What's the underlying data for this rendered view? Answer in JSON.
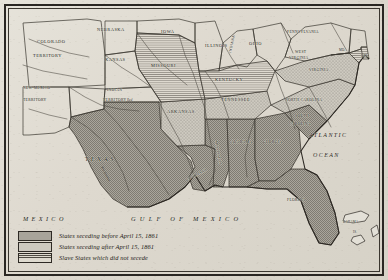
{
  "figure": {
    "name": "secession-map"
  },
  "legend": {
    "name": "map-legend",
    "entries": [
      {
        "swatch": "dense-stipple",
        "label": "States seceding before April 15, 1861"
      },
      {
        "swatch": "light-stipple",
        "label": "States seceding after April 15, 1861"
      },
      {
        "swatch": "horizontal-lines",
        "label": "Slave States which did not secede"
      }
    ]
  },
  "water_bodies": [
    {
      "name": "ATLANTIC",
      "line2": "OCEAN"
    },
    {
      "name": "GULF OF MEXICO"
    }
  ],
  "countries": [
    {
      "name": "MEXICO"
    }
  ],
  "rivers": [
    {
      "name": "Rio Grande"
    },
    {
      "name": "Red"
    }
  ],
  "islands": [
    {
      "name": "BAHAMA",
      "line2": "IS."
    }
  ],
  "territories": [
    {
      "name": "COLORADO",
      "line2": "TERRITORY"
    },
    {
      "name": "NEW MEXICO",
      "line2": "TERRITORY"
    },
    {
      "name": "INDIAN",
      "line2": "TERRITORY"
    }
  ],
  "states": [
    {
      "name": "NEBRASKA",
      "status": "union"
    },
    {
      "name": "IOWA",
      "status": "union"
    },
    {
      "name": "KANSAS",
      "status": "union"
    },
    {
      "name": "ILLINOIS",
      "status": "union"
    },
    {
      "name": "INDIANA",
      "status": "union"
    },
    {
      "name": "OHIO",
      "status": "union"
    },
    {
      "name": "PENNSYLVANIA",
      "status": "union"
    },
    {
      "name": "MISSOURI",
      "status": "slave-did-not-secede"
    },
    {
      "name": "KENTUCKY",
      "status": "slave-did-not-secede"
    },
    {
      "name": "WEST",
      "line2": "VIRGINIA",
      "status": "union"
    },
    {
      "name": "MD.",
      "status": "slave-did-not-secede"
    },
    {
      "name": "DEL.",
      "status": "slave-did-not-secede"
    },
    {
      "name": "VIRGINIA",
      "status": "seceded-after"
    },
    {
      "name": "NORTH CAROLINA",
      "status": "seceded-after"
    },
    {
      "name": "SOUTH",
      "line2": "CAROLINA",
      "status": "seceded-before"
    },
    {
      "name": "TENNESSEE",
      "status": "seceded-after"
    },
    {
      "name": "ARKANSAS",
      "status": "seceded-after"
    },
    {
      "name": "MISSISSIPPI",
      "status": "seceded-before"
    },
    {
      "name": "ALABAMA",
      "status": "seceded-before"
    },
    {
      "name": "GEORGIA",
      "status": "seceded-before"
    },
    {
      "name": "FLORIDA",
      "status": "seceded-before"
    },
    {
      "name": "LOUISIANA",
      "status": "seceded-before"
    },
    {
      "name": "TEXAS",
      "status": "seceded-before"
    }
  ],
  "colors": {
    "paper": "#ded9cf",
    "ink": "#231f1b",
    "seceded_before": "#a8a49a",
    "seceded_after": "#cdc9bf",
    "slave_not_seceded": "#dedacf"
  }
}
